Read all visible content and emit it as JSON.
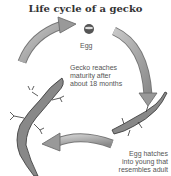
{
  "title": "Life cycle of a gecko",
  "stages": [
    {
      "label": "Egg"
    },
    {
      "label": "Egg hatches into young that resembles adult"
    },
    {
      "label": "Gecko reaches maturity after about 18 months"
    }
  ],
  "labels": {
    "egg": "Egg",
    "hatch_l1": "Egg hatches",
    "hatch_l2": "into young that",
    "hatch_l3": "resembles adult",
    "mature_l1": "Gecko reaches",
    "mature_l2": "maturity after",
    "mature_l3": "about 18 months"
  },
  "colors": {
    "arrow": "#9a9a9a",
    "text": "#555555"
  }
}
